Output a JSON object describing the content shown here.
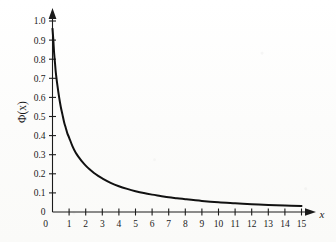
{
  "figure": {
    "background_color": "#fdfdfc",
    "ink_color": "#111111"
  },
  "axis": {
    "y_title": "Φ(x)",
    "x_title": "x"
  },
  "chart_data": {
    "type": "line",
    "title": "",
    "subtitle": "",
    "xlabel": "x",
    "ylabel": "Φ(x)",
    "xlim": [
      0,
      15
    ],
    "ylim": [
      0,
      1.0
    ],
    "grid": false,
    "legend": null,
    "legend_position": "none",
    "x_ticks": [
      0,
      1,
      2,
      3,
      4,
      5,
      6,
      7,
      8,
      9,
      10,
      11,
      12,
      13,
      14,
      15
    ],
    "x_tick_labels": [
      "0",
      "1",
      "2",
      "3",
      "4",
      "5",
      "6",
      "7",
      "8",
      "9",
      "10",
      "11",
      "12",
      "13",
      "14",
      "15"
    ],
    "y_ticks": [
      0,
      0.1,
      0.2,
      0.3,
      0.4,
      0.5,
      0.6,
      0.7,
      0.8,
      0.9,
      1.0
    ],
    "y_tick_labels": [
      "0",
      "0.1",
      "0.2",
      "0.3",
      "0.4",
      "0.5",
      "0.6",
      "0.7",
      "0.8",
      "0.9",
      "1.0"
    ],
    "series": [
      {
        "name": "Φ(x)",
        "color": "#111111",
        "x": [
          0.0,
          0.05,
          0.1,
          0.15,
          0.2,
          0.3,
          0.4,
          0.5,
          0.6,
          0.7,
          0.8,
          0.9,
          1.0,
          1.2,
          1.4,
          1.6,
          1.8,
          2.0,
          2.25,
          2.5,
          2.75,
          3.0,
          3.5,
          4.0,
          4.5,
          5.0,
          5.5,
          6.0,
          6.5,
          7.0,
          7.5,
          8.0,
          9.0,
          10.0,
          11.0,
          12.0,
          13.0,
          14.0,
          15.0
        ],
        "y": [
          0.96,
          0.9,
          0.83,
          0.78,
          0.73,
          0.66,
          0.6,
          0.55,
          0.51,
          0.47,
          0.44,
          0.41,
          0.39,
          0.345,
          0.31,
          0.285,
          0.262,
          0.243,
          0.222,
          0.204,
          0.189,
          0.176,
          0.153,
          0.135,
          0.121,
          0.109,
          0.099,
          0.091,
          0.084,
          0.077,
          0.072,
          0.067,
          0.058,
          0.051,
          0.046,
          0.041,
          0.037,
          0.034,
          0.031
        ]
      }
    ],
    "annotations": []
  }
}
